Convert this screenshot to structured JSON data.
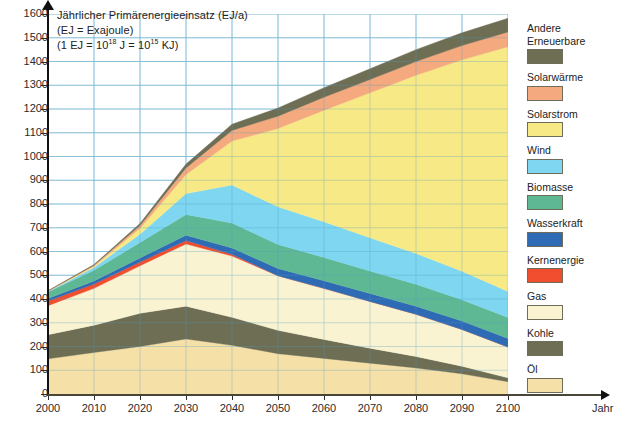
{
  "chart_data": {
    "type": "area",
    "title": "Jährlicher Primärenergieeinsatz (EJ/a)",
    "subtitle_1": "(EJ = Exajoule)",
    "subtitle_2_prefix": "(1 EJ = 10",
    "subtitle_2_exp1": "18",
    "subtitle_2_mid": " J = 10",
    "subtitle_2_exp2": "15",
    "subtitle_2_suffix": " KJ)",
    "xlabel": "Jahr",
    "ylabel": "Jährlicher Primärenergieeinsatz (EJ/a)",
    "x": [
      2000,
      2010,
      2020,
      2030,
      2040,
      2050,
      2060,
      2070,
      2080,
      2090,
      2100
    ],
    "xlim": [
      2000,
      2100
    ],
    "ylim": [
      0,
      1600
    ],
    "xticks": [
      "2000",
      "2010",
      "2020",
      "2030",
      "2040",
      "2050",
      "2060",
      "2070",
      "2080",
      "2090",
      "2100"
    ],
    "yticks": [
      "0",
      "100",
      "200",
      "300",
      "400",
      "500",
      "600",
      "700",
      "800",
      "900",
      "1000",
      "1100",
      "1200",
      "1300",
      "1400",
      "1500",
      "1600"
    ],
    "grid": true,
    "stacked": true,
    "legend_position": "right",
    "series": [
      {
        "name": "Öl",
        "color": "#f5e0a8",
        "values": [
          148,
          175,
          200,
          232,
          205,
          170,
          150,
          130,
          110,
          85,
          52
        ]
      },
      {
        "name": "Kohle",
        "color": "#6e6e55",
        "values": [
          102,
          115,
          140,
          138,
          118,
          98,
          80,
          63,
          48,
          32,
          16
        ]
      },
      {
        "name": "Gas",
        "color": "#f9f3d2",
        "values": [
          122,
          155,
          200,
          262,
          258,
          230,
          215,
          197,
          178,
          155,
          130
        ]
      },
      {
        "name": "Kernenergie",
        "color": "#f04e2e",
        "values": [
          20,
          18,
          16,
          14,
          7,
          0,
          0,
          0,
          0,
          0,
          0
        ]
      },
      {
        "name": "Wasserkraft",
        "color": "#2f6bb5",
        "values": [
          10,
          13,
          17,
          22,
          27,
          30,
          32,
          33,
          34,
          35,
          36
        ]
      },
      {
        "name": "Biomasse",
        "color": "#5fb894",
        "values": [
          28,
          45,
          65,
          88,
          105,
          102,
          98,
          95,
          92,
          90,
          88
        ]
      },
      {
        "name": "Wind",
        "color": "#7fd6f0",
        "values": [
          2,
          12,
          35,
          88,
          160,
          158,
          150,
          140,
          130,
          120,
          110
        ]
      },
      {
        "name": "Solarstrom",
        "color": "#f7ea86",
        "values": [
          1,
          5,
          25,
          80,
          185,
          330,
          470,
          610,
          750,
          890,
          1030
        ]
      },
      {
        "name": "Solarwärme",
        "color": "#f4a97f",
        "values": [
          1,
          4,
          12,
          28,
          45,
          52,
          55,
          56,
          58,
          60,
          62
        ]
      },
      {
        "name": "Andere Erneuerbare",
        "color": "#6e6e55",
        "values": [
          1,
          3,
          8,
          16,
          26,
          34,
          40,
          45,
          50,
          54,
          58
        ]
      }
    ]
  },
  "legend": {
    "items": [
      {
        "label": "Andere\nErneuerbare",
        "color": "#6e6e55"
      },
      {
        "label": "Solarwärme",
        "color": "#f4a97f"
      },
      {
        "label": "Solarstrom",
        "color": "#f7ea86"
      },
      {
        "label": "Wind",
        "color": "#7fd6f0"
      },
      {
        "label": "Biomasse",
        "color": "#5fb894"
      },
      {
        "label": "Wasserkraft",
        "color": "#2f6bb5"
      },
      {
        "label": "Kernenergie",
        "color": "#f04e2e"
      },
      {
        "label": "Gas",
        "color": "#f9f3d2"
      },
      {
        "label": "Kohle",
        "color": "#6e6e55"
      },
      {
        "label": "Öl",
        "color": "#f5e0a8"
      }
    ]
  },
  "colors": {
    "grid": "#8fc4dd",
    "axis": "#111111",
    "background": "#ffffff"
  }
}
